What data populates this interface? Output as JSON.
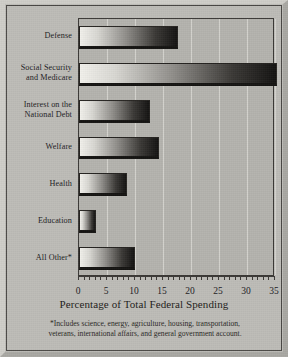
{
  "chart_data": {
    "type": "bar",
    "orientation": "horizontal",
    "title": "",
    "xlabel": "Percentage of Total Federal Spending",
    "ylabel": "",
    "categories": [
      "Defense",
      "Social Security and Medicare",
      "Interest on the National Debt",
      "Welfare",
      "Health",
      "Education",
      "All Other*"
    ],
    "values": [
      17.7,
      35.4,
      12.6,
      14.3,
      8.5,
      3.1,
      10.0
    ],
    "xlim": [
      0,
      35
    ],
    "xticks": [
      0,
      5,
      10,
      15,
      20,
      25,
      30,
      35
    ],
    "xticklabels": [
      "0",
      "5",
      "10",
      "15",
      "20",
      "25",
      "30",
      "35"
    ],
    "minor_tick_interval": 1,
    "grid": "vertical-major",
    "legend": "none",
    "bar_style": "horizontal gradient light-to-dark with drop shadow"
  },
  "category_labels": [
    {
      "line1": "Defense",
      "line2": ""
    },
    {
      "line1": "Social Security",
      "line2": "and Medicare"
    },
    {
      "line1": "Interest on the",
      "line2": "National Debt"
    },
    {
      "line1": "Welfare",
      "line2": ""
    },
    {
      "line1": "Health",
      "line2": ""
    },
    {
      "line1": "Education",
      "line2": ""
    },
    {
      "line1": "All Other*",
      "line2": ""
    }
  ],
  "axis": {
    "title": "Percentage of Total Federal Spending",
    "tick_0": "0",
    "tick_1": "5",
    "tick_2": "10",
    "tick_3": "15",
    "tick_4": "20",
    "tick_5": "25",
    "tick_6": "30",
    "tick_7": "35"
  },
  "footnote": {
    "line1": "*Includes science, energy, agriculture, housing, transportation,",
    "line2": "veterans, international affairs, and general government account."
  },
  "colors": {
    "paper": "#bdbcb7",
    "plot_background": "#b4b3ae",
    "gridline": "#d5d4cf",
    "frame": "#4a4845",
    "bar_light": "#f2f1ec",
    "bar_dark": "#141312",
    "text": "#23211f"
  }
}
